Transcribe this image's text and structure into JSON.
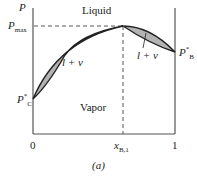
{
  "figure": {
    "caption": "(a)",
    "y_axis_label": "P",
    "p_max_label": "P",
    "p_max_sub": "max",
    "p_c_label": "P",
    "p_c_sup": "*",
    "p_c_sub": "C",
    "p_b_label": "P",
    "p_b_sup": "*",
    "p_b_sub": "B",
    "x_tick_0": "0",
    "x_tick_1": "1",
    "x_azeo_label": "x",
    "x_azeo_sub": "B,1",
    "region_liquid": "Liquid",
    "region_vapor": "Vapor",
    "region_lv_left": "l + v",
    "region_lv_right": "l + v"
  },
  "colors": {
    "two_phase_fill": "#b3b3b3",
    "curve": "#222222",
    "axis": "#555555"
  }
}
